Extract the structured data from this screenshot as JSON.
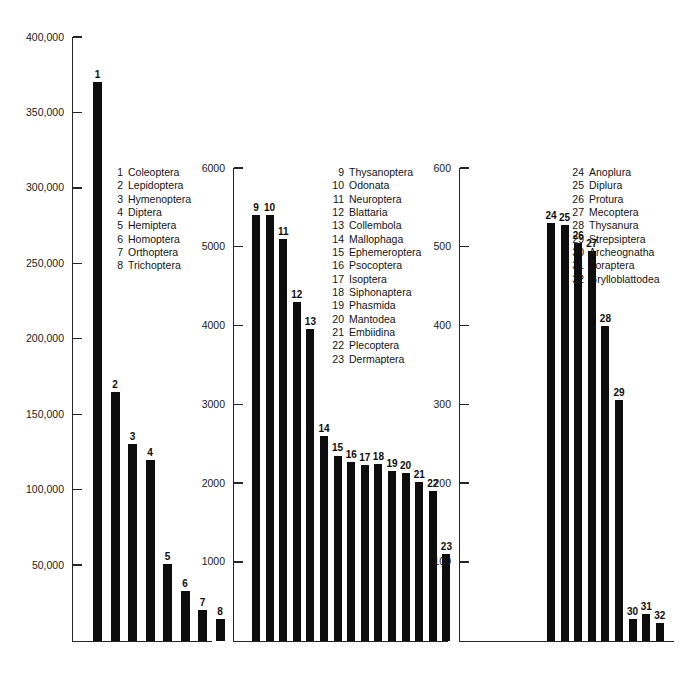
{
  "top_caption": "",
  "chart_data": {
    "type": "bar",
    "title": "",
    "xlabel": "",
    "ylabel": "",
    "grid": false,
    "legend_position": "inside-panels",
    "note": "Three-panel bar chart of described species counts per insect order; each panel has its own y-axis scale.",
    "panels": [
      {
        "id": "panel-1",
        "ylim": [
          0,
          400000
        ],
        "yticks": [
          50000,
          100000,
          150000,
          200000,
          250000,
          300000,
          350000,
          400000
        ],
        "ytick_labels": [
          "50,000",
          "100,000",
          "150,000",
          "200,000",
          "250,000",
          "300,000",
          "350,000",
          "400,000"
        ],
        "categories": [
          "1",
          "2",
          "3",
          "4",
          "5",
          "6",
          "7",
          "8"
        ],
        "values": [
          370000,
          165000,
          130000,
          120000,
          51000,
          33000,
          20000,
          14000
        ],
        "legend": [
          {
            "num": "1",
            "name": "Coleoptera"
          },
          {
            "num": "2",
            "name": "Lepidoptera"
          },
          {
            "num": "3",
            "name": "Hymenoptera"
          },
          {
            "num": "4",
            "name": "Diptera"
          },
          {
            "num": "5",
            "name": "Hemiptera"
          },
          {
            "num": "6",
            "name": "Homoptera"
          },
          {
            "num": "7",
            "name": "Orthoptera"
          },
          {
            "num": "8",
            "name": "Trichoptera"
          }
        ]
      },
      {
        "id": "panel-2",
        "ylim": [
          0,
          6000
        ],
        "yticks": [
          1000,
          2000,
          3000,
          4000,
          5000,
          6000
        ],
        "ytick_labels": [
          "1000",
          "2000",
          "3000",
          "4000",
          "5000",
          "6000"
        ],
        "categories": [
          "9",
          "10",
          "11",
          "12",
          "13",
          "14",
          "15",
          "16",
          "17",
          "18",
          "19",
          "20",
          "21",
          "22",
          "23"
        ],
        "values": [
          5400,
          5400,
          5100,
          4300,
          3950,
          2600,
          2350,
          2270,
          2230,
          2240,
          2150,
          2130,
          2010,
          1900,
          1100
        ],
        "legend": [
          {
            "num": "9",
            "name": "Thysanoptera"
          },
          {
            "num": "10",
            "name": "Odonata"
          },
          {
            "num": "11",
            "name": "Neuroptera"
          },
          {
            "num": "12",
            "name": "Blattaria"
          },
          {
            "num": "13",
            "name": "Collembola"
          },
          {
            "num": "14",
            "name": "Mallophaga"
          },
          {
            "num": "15",
            "name": "Ephemeroptera"
          },
          {
            "num": "16",
            "name": "Psocoptera"
          },
          {
            "num": "17",
            "name": "Isoptera"
          },
          {
            "num": "18",
            "name": "Siphonaptera"
          },
          {
            "num": "19",
            "name": "Phasmida"
          },
          {
            "num": "20",
            "name": "Mantodea"
          },
          {
            "num": "21",
            "name": "Embiidina"
          },
          {
            "num": "22",
            "name": "Plecoptera"
          },
          {
            "num": "23",
            "name": "Dermaptera"
          }
        ]
      },
      {
        "id": "panel-3",
        "ylim": [
          0,
          600
        ],
        "yticks": [
          100,
          200,
          300,
          400,
          500,
          600
        ],
        "ytick_labels": [
          "100",
          "200",
          "300",
          "400",
          "500",
          "600"
        ],
        "categories": [
          "24",
          "25",
          "26",
          "27",
          "28",
          "29",
          "30",
          "31",
          "32"
        ],
        "values": [
          530,
          528,
          505,
          495,
          400,
          305,
          28,
          34,
          22
        ],
        "legend": [
          {
            "num": "24",
            "name": "Anoplura"
          },
          {
            "num": "25",
            "name": "Diplura"
          },
          {
            "num": "26",
            "name": "Protura"
          },
          {
            "num": "27",
            "name": "Mecoptera"
          },
          {
            "num": "28",
            "name": "Thysanura"
          },
          {
            "num": "29",
            "name": "Strepsiptera"
          },
          {
            "num": "30",
            "name": "Archeognatha"
          },
          {
            "num": "31",
            "name": "Zoraptera"
          },
          {
            "num": "32",
            "name": "Grylloblattodea"
          }
        ]
      }
    ]
  },
  "colors": {
    "bar": "#0d0d0d",
    "axis": "#262626",
    "text": "#1a1a1a",
    "background": "#ffffff"
  }
}
